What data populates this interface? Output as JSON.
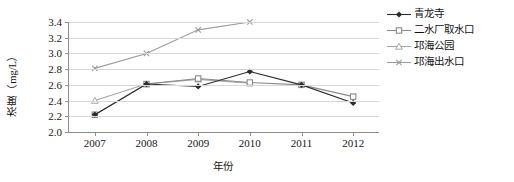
{
  "chart_data": {
    "type": "line",
    "title": "",
    "xlabel": "年份",
    "ylabel": "浓度（mg/L）",
    "categories": [
      "2007",
      "2008",
      "2009",
      "2010",
      "2011",
      "2012"
    ],
    "x": [
      2007,
      2008,
      2009,
      2010,
      2011,
      2012
    ],
    "ylim": [
      2.0,
      3.4
    ],
    "yticks": [
      "2.0",
      "2.2",
      "2.4",
      "2.6",
      "2.8",
      "3.0",
      "3.2",
      "3.4"
    ],
    "ytick_values": [
      2.0,
      2.2,
      2.4,
      2.6,
      2.8,
      3.0,
      3.2,
      3.4
    ],
    "grid": true,
    "legend_position": "right",
    "series": [
      {
        "name": "青龙寺",
        "marker": "filled-diamond",
        "color": "#2b2b2b",
        "values": [
          2.22,
          2.61,
          2.58,
          2.77,
          2.6,
          2.37
        ]
      },
      {
        "name": "二水厂取水口",
        "marker": "filled-square",
        "color": "#8a8a8a",
        "values": [
          2.22,
          2.61,
          2.68,
          2.63,
          2.6,
          2.45
        ]
      },
      {
        "name": "邛海公园",
        "marker": "triangle",
        "color": "#a6a6a6",
        "values": [
          2.4,
          2.61,
          2.67,
          2.62,
          null,
          null
        ]
      },
      {
        "name": "邛海出水口",
        "marker": "cross",
        "color": "#9c9c9c",
        "values": [
          2.81,
          3.0,
          3.3,
          3.4,
          null,
          null
        ]
      }
    ]
  },
  "axis": {
    "y_title": "浓度（mg/L）",
    "x_title": "年份"
  }
}
